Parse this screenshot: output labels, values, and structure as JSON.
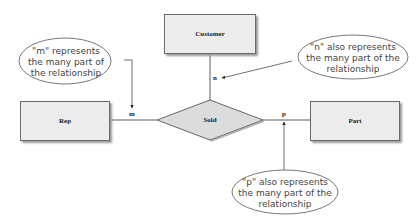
{
  "diagram": {
    "type": "entity-relationship",
    "entities": [
      {
        "id": "customer",
        "label": "Customer"
      },
      {
        "id": "rep",
        "label": "Rep"
      },
      {
        "id": "part",
        "label": "Part"
      }
    ],
    "relationship": {
      "label": "Sold"
    },
    "cardinalities": {
      "rep": "m",
      "customer": "n",
      "part": "p"
    },
    "notes": {
      "m": "\"m\" represents the many part of the relationship",
      "n": "\"n\" also represents the many part of the relationship",
      "p": "\"p\" also represents the many part of the relationship"
    },
    "colors": {
      "entity_fill": "#ececec",
      "relationship_fill": "#dcdcdc",
      "line": "#333333"
    }
  }
}
